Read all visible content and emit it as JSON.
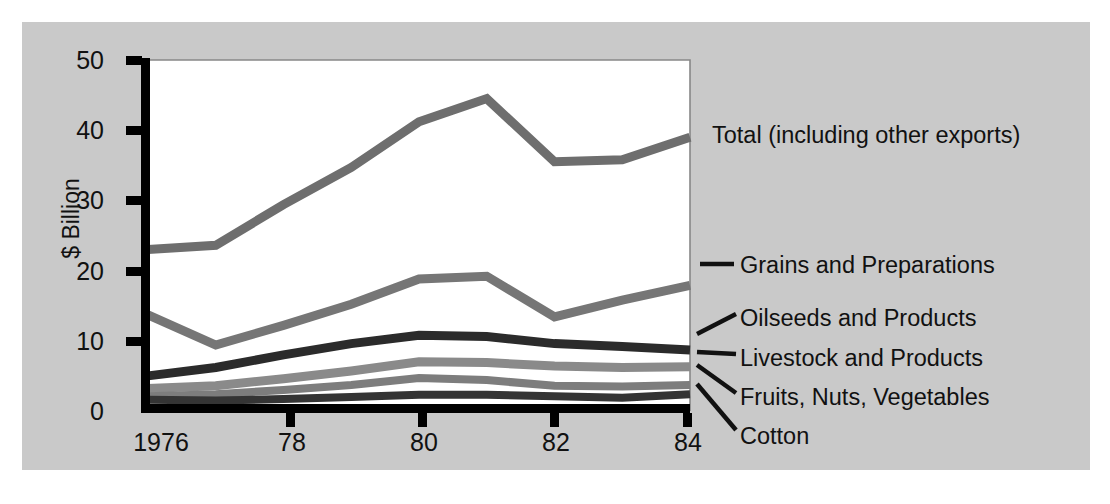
{
  "chart_data": {
    "type": "line",
    "title": "",
    "xlabel": "",
    "ylabel": "$ Billion",
    "x": [
      1976,
      1977,
      1978,
      1979,
      1980,
      1981,
      1982,
      1983,
      1984
    ],
    "xtick_labels": [
      "1976",
      "78",
      "80",
      "82",
      "84"
    ],
    "xtick_values": [
      1976,
      1978,
      1980,
      1982,
      1984
    ],
    "ytick_labels": [
      "0",
      "10",
      "20",
      "30",
      "40",
      "50"
    ],
    "ytick_values": [
      0,
      10,
      20,
      30,
      40,
      50
    ],
    "ylim": [
      0,
      50
    ],
    "xlim": [
      1976,
      1984
    ],
    "grid": false,
    "legend_position": "right-annotations",
    "series": [
      {
        "name": "Total (including other exports)",
        "color": "#6e6e6e",
        "values": [
          23.0,
          23.6,
          29.4,
          34.7,
          41.2,
          44.5,
          35.5,
          35.8,
          39.0
        ]
      },
      {
        "name": "Grains and Preparations",
        "color": "#767676",
        "values": [
          13.7,
          9.4,
          12.2,
          15.2,
          18.8,
          19.2,
          13.4,
          15.8,
          17.9
        ]
      },
      {
        "name": "Oilseeds and Products",
        "color": "#2b2b2b",
        "values": [
          5.0,
          6.2,
          8.0,
          9.6,
          10.8,
          10.6,
          9.6,
          9.2,
          8.7
        ]
      },
      {
        "name": "Livestock and Products",
        "color": "#8a8a8a",
        "values": [
          3.2,
          3.6,
          4.6,
          5.7,
          7.0,
          6.9,
          6.4,
          6.2,
          6.3
        ]
      },
      {
        "name": "Fruits, Nuts, Vegetables",
        "color": "#7d7d7d",
        "values": [
          2.1,
          2.4,
          3.0,
          3.7,
          4.7,
          4.4,
          3.6,
          3.5,
          3.7
        ]
      },
      {
        "name": "Cotton",
        "color": "#343434",
        "values": [
          1.6,
          1.5,
          1.7,
          2.0,
          2.3,
          2.3,
          2.1,
          1.9,
          2.4
        ]
      }
    ],
    "annotations": [
      {
        "label": "Total (including other exports)"
      },
      {
        "label": "Grains and Preparations"
      },
      {
        "label": "Oilseeds and Products"
      },
      {
        "label": "Livestock and Products"
      },
      {
        "label": "Fruits, Nuts, Vegetables"
      },
      {
        "label": "Cotton"
      }
    ],
    "colors": {
      "background": "#c9c9c9",
      "plot_background": "#ffffff",
      "axis": "#000000",
      "page": "#ffffff"
    }
  }
}
